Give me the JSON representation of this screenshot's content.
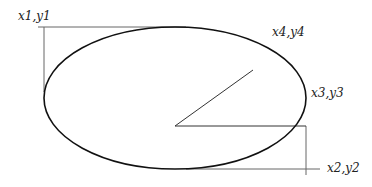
{
  "diagram": {
    "type": "ellipse-bounding-box",
    "labels": {
      "top_left": "x1,y1",
      "bottom_right": "x2,y2",
      "start_point": "x3,y3",
      "end_point": "x4,y4"
    },
    "colors": {
      "ellipse_stroke": "#111111",
      "guide_lines": "#666666",
      "text": "#222222",
      "background": "#ffffff"
    }
  }
}
